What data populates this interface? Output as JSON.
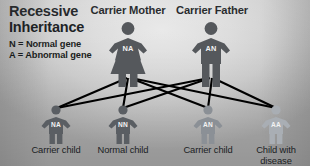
{
  "diagram": {
    "title": {
      "line1": "Recessive",
      "line2": "Inheritance"
    },
    "legend": [
      "N = Normal gene",
      "A = Abnormal gene"
    ],
    "background_color": "#d8d8d8",
    "line_color": "#000000"
  },
  "parents": [
    {
      "label": "Carrier Mother",
      "genotype": "NA",
      "sex": "female",
      "color": "#55585c",
      "x": 128
    },
    {
      "label": "Carrier Father",
      "genotype": "AN",
      "sex": "male",
      "color": "#55585c",
      "x": 211
    }
  ],
  "children": [
    {
      "genotype": "NA",
      "caption": "Carrier child",
      "color": "#5a5e63",
      "x": 56
    },
    {
      "genotype": "NN",
      "caption": "Normal child",
      "color": "#5a5e63",
      "x": 123
    },
    {
      "genotype": "AN",
      "caption": "Carrier child",
      "color": "#8b9096",
      "x": 208
    },
    {
      "genotype": "AA",
      "caption": "Child with\ndisease",
      "color": "#a9aeb4",
      "x": 276
    }
  ]
}
